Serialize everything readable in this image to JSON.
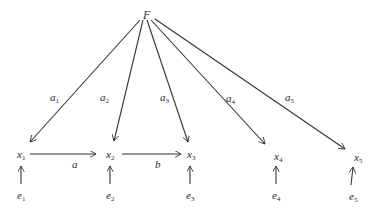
{
  "diagram": {
    "factor": {
      "label": "F",
      "x": 148,
      "y": 15
    },
    "variables": [
      {
        "id": "x1",
        "base": "x",
        "sub": "1",
        "x": 19,
        "y": 158
      },
      {
        "id": "x2",
        "base": "x",
        "sub": "2",
        "x": 107,
        "y": 158
      },
      {
        "id": "x3",
        "base": "x",
        "sub": "3",
        "x": 189,
        "y": 158
      },
      {
        "id": "x4",
        "base": "x",
        "sub": "4",
        "x": 276,
        "y": 161
      },
      {
        "id": "x5",
        "base": "x",
        "sub": "5",
        "x": 355,
        "y": 161
      }
    ],
    "errors": [
      {
        "id": "e1",
        "base": "e",
        "sub": "1",
        "x": 19,
        "y": 199
      },
      {
        "id": "e2",
        "base": "e",
        "sub": "2",
        "x": 107,
        "y": 199
      },
      {
        "id": "e3",
        "base": "e",
        "sub": "3",
        "x": 188,
        "y": 199
      },
      {
        "id": "e4",
        "base": "e",
        "sub": "4",
        "x": 273,
        "y": 199
      },
      {
        "id": "e5",
        "base": "e",
        "sub": "5",
        "x": 350,
        "y": 200
      }
    ],
    "loadings": [
      {
        "base": "a",
        "sub": "1",
        "x": 50,
        "y": 101
      },
      {
        "base": "a",
        "sub": "2",
        "x": 100,
        "y": 101
      },
      {
        "base": "a",
        "sub": "3",
        "x": 161,
        "y": 101
      },
      {
        "base": "a",
        "sub": "4",
        "x": 226,
        "y": 102
      },
      {
        "base": "a",
        "sub": "5",
        "x": 285,
        "y": 101
      }
    ],
    "paths": [
      {
        "label": "a",
        "x": 72,
        "y": 168
      },
      {
        "label": "b",
        "x": 155,
        "y": 168
      }
    ]
  }
}
